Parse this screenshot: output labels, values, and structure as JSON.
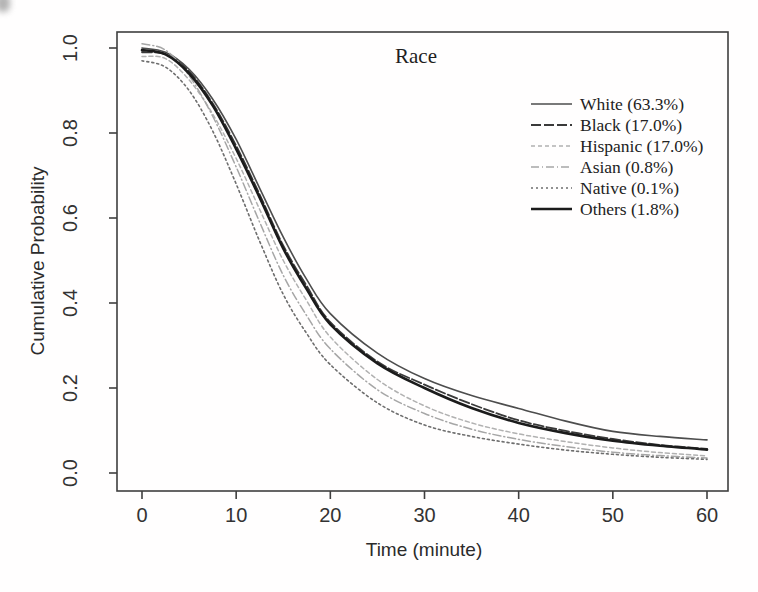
{
  "figure": {
    "title": "Race",
    "xlabel": "Time (minute)",
    "ylabel": "Cumulative Probability"
  },
  "chart_data": {
    "type": "line",
    "title": "Race",
    "xlabel": "Time (minute)",
    "ylabel": "Cumulative Probability",
    "xlim": [
      0,
      60
    ],
    "ylim": [
      0.0,
      1.0
    ],
    "x_ticks": [
      0,
      10,
      20,
      30,
      40,
      50,
      60
    ],
    "y_ticks": [
      "0.0",
      "0.2",
      "0.4",
      "0.6",
      "0.8",
      "1.0"
    ],
    "grid": false,
    "legend_position": "top-right-inside",
    "axis_color": "#3f3f3f",
    "x": [
      0,
      2.5,
      5,
      7.5,
      10,
      12.5,
      15,
      17.5,
      20,
      25,
      30,
      35,
      40,
      45,
      50,
      55,
      60
    ],
    "series": [
      {
        "name": "white",
        "label": "White (63.3%)",
        "color": "#4d4d4d",
        "width": 1.6,
        "dash": "",
        "values": [
          1.0,
          0.99,
          0.95,
          0.88,
          0.785,
          0.67,
          0.555,
          0.455,
          0.375,
          0.282,
          0.222,
          0.182,
          0.152,
          0.122,
          0.098,
          0.086,
          0.078
        ]
      },
      {
        "name": "black",
        "label": "Black (17.0%)",
        "color": "#3a3a3a",
        "width": 1.8,
        "dash": "10,3",
        "values": [
          0.99,
          0.985,
          0.945,
          0.87,
          0.77,
          0.655,
          0.535,
          0.44,
          0.355,
          0.262,
          0.208,
          0.162,
          0.124,
          0.099,
          0.08,
          0.066,
          0.057
        ]
      },
      {
        "name": "hispanic",
        "label": "Hispanic (17.0%)",
        "color": "#b1b1b1",
        "width": 1.5,
        "dash": "4,3",
        "values": [
          0.98,
          0.975,
          0.925,
          0.845,
          0.74,
          0.62,
          0.5,
          0.405,
          0.32,
          0.22,
          0.158,
          0.118,
          0.092,
          0.074,
          0.059,
          0.048,
          0.04
        ]
      },
      {
        "name": "asian",
        "label": "Asian (0.8%)",
        "color": "#a6a6a6",
        "width": 1.5,
        "dash": "8,3,1,3",
        "values": [
          1.01,
          0.995,
          0.935,
          0.84,
          0.72,
          0.59,
          0.465,
          0.37,
          0.292,
          0.196,
          0.14,
          0.103,
          0.079,
          0.062,
          0.049,
          0.041,
          0.035
        ]
      },
      {
        "name": "native",
        "label": "Native (0.1%)",
        "color": "#6e6e6e",
        "width": 1.6,
        "dash": "2,3",
        "values": [
          0.97,
          0.955,
          0.9,
          0.805,
          0.68,
          0.545,
          0.42,
          0.328,
          0.255,
          0.165,
          0.113,
          0.086,
          0.068,
          0.054,
          0.044,
          0.037,
          0.032
        ]
      },
      {
        "name": "others",
        "label": "Others (1.8%)",
        "color": "#1b1b1b",
        "width": 2.6,
        "dash": "",
        "values": [
          0.995,
          0.985,
          0.94,
          0.865,
          0.762,
          0.648,
          0.528,
          0.432,
          0.35,
          0.258,
          0.2,
          0.153,
          0.118,
          0.094,
          0.076,
          0.064,
          0.055
        ]
      }
    ]
  }
}
